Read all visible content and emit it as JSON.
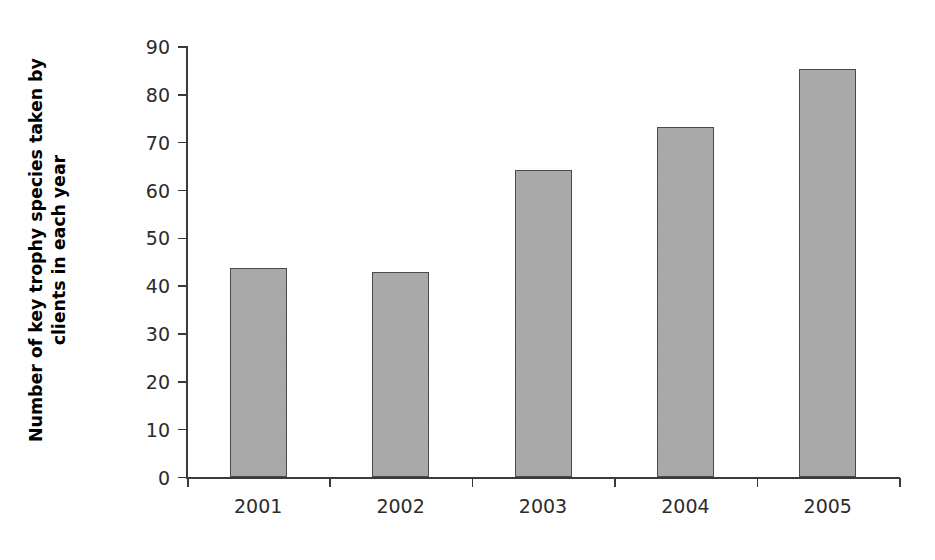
{
  "chart_data": {
    "type": "bar",
    "title": "",
    "xlabel": "",
    "ylabel": "Number of key trophy species taken by clients in each year",
    "ylabel_line1": "Number of key trophy species taken by",
    "ylabel_line2": "clients in each year",
    "categories": [
      "2001",
      "2002",
      "2003",
      "2004",
      "2005"
    ],
    "values": [
      43.7,
      43.0,
      64.3,
      73.3,
      85.5
    ],
    "ylim": [
      0,
      90
    ],
    "ytick_step": 10,
    "yticks": [
      "90",
      "80",
      "70",
      "60",
      "50",
      "40",
      "30",
      "20",
      "10",
      "0"
    ],
    "ytick_values": [
      90,
      80,
      70,
      60,
      50,
      40,
      30,
      20,
      10,
      0
    ],
    "grid": false,
    "legend": false,
    "legend_position": "none",
    "series": [
      {
        "name": "Key trophy species taken",
        "values": [
          43.7,
          43.0,
          64.3,
          73.3,
          85.5
        ]
      }
    ],
    "colors": {
      "bar_fill": "#a9a9a9",
      "bar_border": "#4a4a4a",
      "axis": "#3a3a3a",
      "text": "#2b2b2b",
      "background": "#ffffff"
    }
  }
}
